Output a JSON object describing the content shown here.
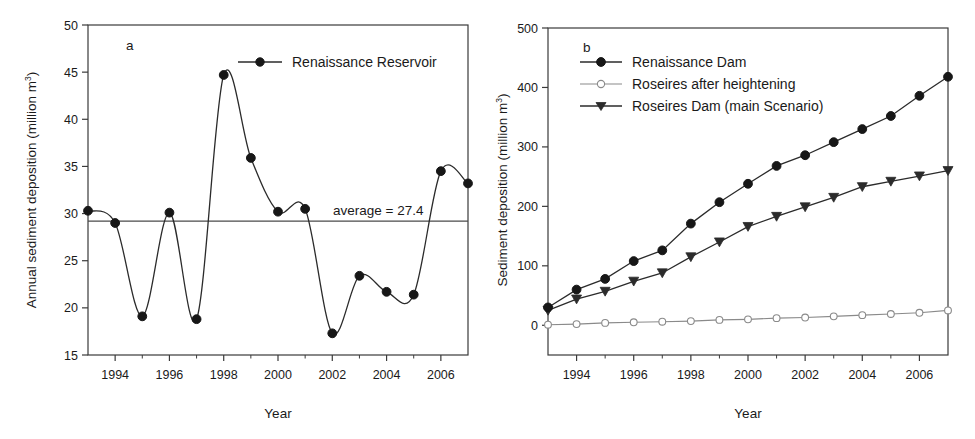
{
  "figure": {
    "background": "#ffffff",
    "panels": [
      "a",
      "b"
    ]
  },
  "panel_a": {
    "label": "a",
    "xlabel": "Year",
    "ylabel_main": "Annual sediment deposition (million m",
    "ylabel_sup": "3",
    "ylabel_tail": ")",
    "legend": [
      {
        "label": "Renaissance Reservoir",
        "marker": "filled-circle",
        "color": "#171717"
      }
    ],
    "annotation": "average = 27.4",
    "y_ticks": [
      "50",
      "45",
      "40",
      "35",
      "30",
      "25",
      "20",
      "15"
    ],
    "x_ticks": [
      "1994",
      "1996",
      "1998",
      "2000",
      "2002",
      "2004",
      "2006"
    ]
  },
  "panel_b": {
    "label": "b",
    "xlabel": "Year",
    "ylabel_main": "Sediment deposition (million m",
    "ylabel_sup": "3",
    "ylabel_tail": ")",
    "legend": [
      {
        "label": "Renaissance Dam",
        "marker": "filled-circle",
        "color": "#171717"
      },
      {
        "label": "Roseires after heightening",
        "marker": "open-circle",
        "color": "#8a8a8a"
      },
      {
        "label": "Roseires Dam (main Scenario)",
        "marker": "filled-triangle-down",
        "color": "#2b2b2b"
      }
    ],
    "y_ticks": [
      "500",
      "400",
      "300",
      "200",
      "100",
      "0"
    ],
    "x_ticks": [
      "1994",
      "1996",
      "1998",
      "2000",
      "2002",
      "2004",
      "2006"
    ]
  },
  "chart_data": [
    {
      "type": "line",
      "panel": "a",
      "title": "Annual sediment deposition - Renaissance Reservoir",
      "xlabel": "Year",
      "ylabel": "Annual sediment deposition (million m3)",
      "xlim": [
        1993,
        2007
      ],
      "ylim": [
        15,
        50
      ],
      "grid": false,
      "legend_position": "top-right",
      "x": [
        1993,
        1994,
        1995,
        1996,
        1997,
        1998,
        1999,
        2000,
        2001,
        2002,
        2003,
        2004,
        2005,
        2006,
        2007
      ],
      "xtick_labels": [
        "1994",
        "1996",
        "1998",
        "2000",
        "2002",
        "2004",
        "2006"
      ],
      "xtick_values": [
        1994,
        1996,
        1998,
        2000,
        2002,
        2004,
        2006
      ],
      "ytick_values": [
        15,
        20,
        25,
        30,
        35,
        40,
        45,
        50
      ],
      "series": [
        {
          "name": "Renaissance Reservoir",
          "marker": "filled-circle",
          "smoothed": true,
          "values": [
            30.3,
            29.0,
            19.1,
            30.1,
            18.8,
            44.7,
            35.9,
            30.2,
            30.5,
            17.3,
            23.4,
            21.7,
            21.4,
            34.5,
            33.2
          ]
        }
      ],
      "annotations": [
        {
          "text": "average = 27.4",
          "type": "horizontal-reference-line",
          "value": 27.4,
          "drawn_at": 29.2
        }
      ]
    },
    {
      "type": "line",
      "panel": "b",
      "title": "Cumulative sediment deposition",
      "xlabel": "Year",
      "ylabel": "Sediment deposition (million m3)",
      "xlim": [
        1993,
        2007
      ],
      "ylim": [
        -50,
        500
      ],
      "grid": false,
      "legend_position": "top-left",
      "x": [
        1993,
        1994,
        1995,
        1996,
        1997,
        1998,
        1999,
        2000,
        2001,
        2002,
        2003,
        2004,
        2005,
        2006,
        2007
      ],
      "xtick_labels": [
        "1994",
        "1996",
        "1998",
        "2000",
        "2002",
        "2004",
        "2006"
      ],
      "xtick_values": [
        1994,
        1996,
        1998,
        2000,
        2002,
        2004,
        2006
      ],
      "ytick_values": [
        0,
        100,
        200,
        300,
        400,
        500
      ],
      "series": [
        {
          "name": "Renaissance Dam",
          "marker": "filled-circle",
          "values": [
            30,
            60,
            78,
            108,
            126,
            171,
            207,
            238,
            268,
            286,
            308,
            330,
            352,
            386,
            418
          ]
        },
        {
          "name": "Roseires after heightening",
          "marker": "open-circle",
          "values": [
            1,
            2,
            4,
            5,
            6,
            7,
            9,
            10,
            12,
            13,
            15,
            17,
            19,
            21,
            25
          ]
        },
        {
          "name": "Roseires Dam (main Scenario)",
          "marker": "filled-triangle-down",
          "values": [
            25,
            44,
            57,
            74,
            88,
            115,
            140,
            166,
            183,
            199,
            215,
            233,
            242,
            251,
            260
          ]
        }
      ]
    }
  ]
}
